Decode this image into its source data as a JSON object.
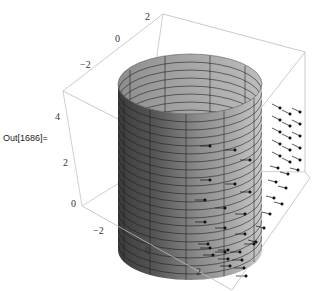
{
  "cell": {
    "output_label": "Out[1686]="
  },
  "plot": {
    "type": "3d-surface-with-vector-field",
    "description": "Cylinder surface with arrow vector field",
    "axes": {
      "x_ticks": [
        "-2",
        "0",
        "2"
      ],
      "y_ticks": [
        "-2",
        "0",
        "2"
      ],
      "z_ticks": [
        "0",
        "2",
        "4"
      ]
    },
    "colors": {
      "box": "#b8b8b8",
      "surface_light": "#c4c4c4",
      "surface_dark": "#4a4a4a",
      "mesh": "#1a1a1a",
      "arrows": "#111111"
    }
  }
}
